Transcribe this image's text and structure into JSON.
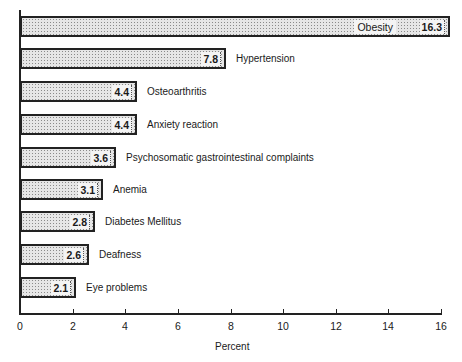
{
  "chart_data": {
    "type": "bar",
    "orientation": "horizontal",
    "title": "",
    "xlabel": "Percent",
    "ylabel": "",
    "xlim": [
      0,
      16
    ],
    "x_ticks": [
      0,
      2,
      4,
      6,
      8,
      10,
      12,
      14,
      16
    ],
    "grid": false,
    "legend": null,
    "categories": [
      "Obesity",
      "Hypertension",
      "Osteoarthritis",
      "Anxiety reaction",
      "Psychosomatic gastrointestinal complaints",
      "Anemia",
      "Diabetes Mellitus",
      "Deafness",
      "Eye problems"
    ],
    "values": [
      16.3,
      7.8,
      4.4,
      4.4,
      3.6,
      3.1,
      2.8,
      2.6,
      2.1
    ],
    "value_labels": [
      "16.3",
      "7.8",
      "4.4",
      "4.4",
      "3.6",
      "3.1",
      "2.8",
      "2.6",
      "2.1"
    ],
    "bar_fill": "stippled gray",
    "bar_edge_color": "#222222"
  }
}
